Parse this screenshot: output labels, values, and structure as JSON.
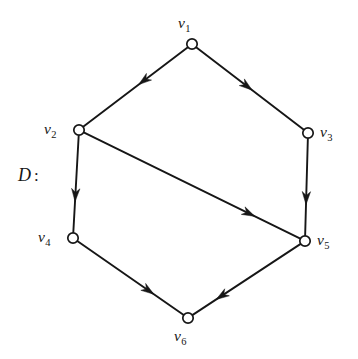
{
  "figure": {
    "name": "directed-graph-D",
    "diagram_label": "D",
    "diagram_label_colon": ":",
    "background_color": "#ffffff",
    "ink_color": "#161616",
    "node_fill_color": "#ffffff",
    "width": 358,
    "height": 359
  },
  "nodes": [
    {
      "id": "v1",
      "letter": "v",
      "subscript": "1",
      "x": 192,
      "y": 44,
      "label_x": 178,
      "label_y": 15,
      "label_anchor": "above"
    },
    {
      "id": "v2",
      "letter": "v",
      "subscript": "2",
      "x": 79,
      "y": 130,
      "label_x": 44,
      "label_y": 121,
      "label_anchor": "left"
    },
    {
      "id": "v3",
      "letter": "v",
      "subscript": "3",
      "x": 308,
      "y": 133,
      "label_x": 320,
      "label_y": 124,
      "label_anchor": "right"
    },
    {
      "id": "v4",
      "letter": "v",
      "subscript": "4",
      "x": 73,
      "y": 238,
      "label_x": 38,
      "label_y": 229,
      "label_anchor": "left"
    },
    {
      "id": "v5",
      "letter": "v",
      "subscript": "5",
      "x": 305,
      "y": 241,
      "label_x": 317,
      "label_y": 232,
      "label_anchor": "right"
    },
    {
      "id": "v6",
      "letter": "v",
      "subscript": "6",
      "x": 188,
      "y": 318,
      "label_x": 174,
      "label_y": 328,
      "label_anchor": "below"
    }
  ],
  "edges": [
    {
      "id": "e-v1-v2",
      "from": "v1",
      "to": "v2",
      "directed": true,
      "arrow_t": 0.47
    },
    {
      "id": "e-v1-v3",
      "from": "v1",
      "to": "v3",
      "directed": true,
      "arrow_t": 0.52
    },
    {
      "id": "e-v2-v4",
      "from": "v2",
      "to": "v4",
      "directed": true,
      "arrow_t": 0.68
    },
    {
      "id": "e-v2-v5",
      "from": "v2",
      "to": "v5",
      "directed": true,
      "arrow_t": 0.79
    },
    {
      "id": "e-v3-v5",
      "from": "v3",
      "to": "v5",
      "directed": true,
      "arrow_t": 0.68
    },
    {
      "id": "e-v4-v6",
      "from": "v4",
      "to": "v6",
      "directed": true,
      "arrow_t": 0.72
    },
    {
      "id": "e-v5-v6",
      "from": "v5",
      "to": "v6",
      "directed": true,
      "arrow_t": 0.78
    }
  ],
  "style": {
    "node_radius": 5.2,
    "node_stroke_width": 1.7,
    "edge_stroke_width": 1.9,
    "arrow_length": 13,
    "arrow_half_width": 4.2
  }
}
